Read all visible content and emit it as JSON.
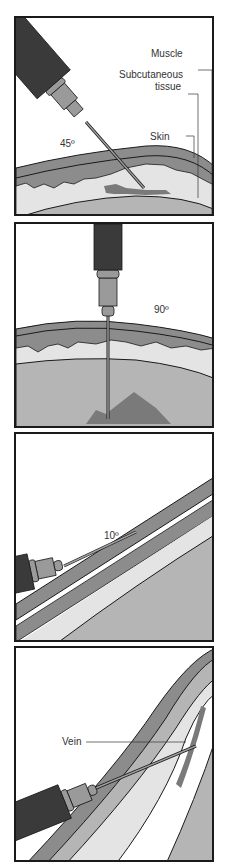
{
  "panels": [
    {
      "name": "intramuscular",
      "angle": "45º",
      "labels": {
        "muscle": "Muscle",
        "subq_1": "Subcutaneous",
        "subq_2": "tissue",
        "skin": "Skin"
      }
    },
    {
      "name": "subcutaneous",
      "angle": "90º"
    },
    {
      "name": "intradermal",
      "angle": "10º"
    },
    {
      "name": "intravenous",
      "labels": {
        "vein": "Vein"
      }
    }
  ],
  "colors": {
    "skin": "#8c8c8c",
    "subq": "#e4e4e4",
    "muscle": "#b5b5b5",
    "syringe": "#3a3a3a",
    "hub": "#9a9a9a",
    "med": "#7a7a7a",
    "outline": "#1a1a1a"
  }
}
